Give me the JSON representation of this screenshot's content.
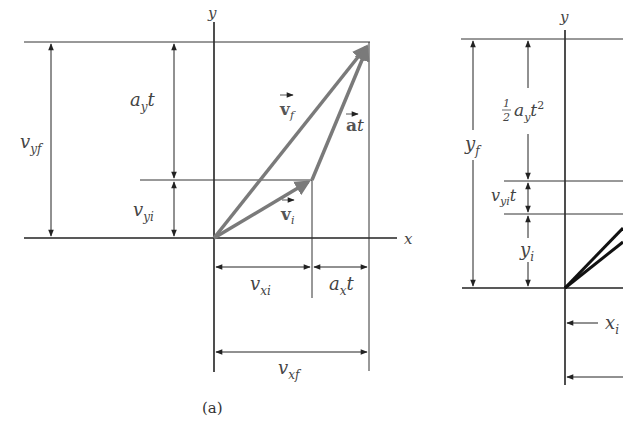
{
  "colors": {
    "vector": "#7a7a7a",
    "line": "#333333",
    "text": "#444444",
    "vector_dark": "#111111"
  },
  "figure_a": {
    "caption": "(a)",
    "axis_labels": {
      "x": "x",
      "y": "y"
    },
    "dims": {
      "vyf": {
        "main": "v",
        "sub": "yf"
      },
      "ayt": {
        "main": "a",
        "sub": "y",
        "tail": "t"
      },
      "vyi": {
        "main": "v",
        "sub": "yi"
      },
      "vxi": {
        "main": "v",
        "sub": "xi"
      },
      "axt": {
        "main": "a",
        "sub": "x",
        "tail": "t"
      },
      "vxf": {
        "main": "v",
        "sub": "xf"
      }
    },
    "vectors": {
      "vf": {
        "main": "v",
        "sub": "f"
      },
      "vi": {
        "main": "v",
        "sub": "i"
      },
      "at": {
        "main": "a",
        "tail": "t"
      }
    }
  },
  "figure_b": {
    "axis_labels": {
      "y": "y"
    },
    "dims": {
      "yf": {
        "main": "y",
        "sub": "f"
      },
      "half_ayt2": {
        "num": "1",
        "den": "2",
        "main": "a",
        "sub": "y",
        "tail": "t",
        "sup": "2"
      },
      "vyit": {
        "main": "v",
        "sub": "yi",
        "tail": "t"
      },
      "yi": {
        "main": "y",
        "sub": "i"
      },
      "xi": {
        "main": "x",
        "sub": "i"
      }
    }
  }
}
